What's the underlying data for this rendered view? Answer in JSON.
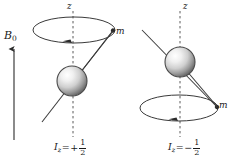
{
  "figure": {
    "background_color": "#ffffff",
    "stroke_color": "#3a3a3a",
    "text_color": "#1a1a1a",
    "width": 237,
    "height": 163
  },
  "field": {
    "symbol": "B",
    "subscript": "0",
    "arrow_direction": "up"
  },
  "panels": [
    {
      "id": "spin-up",
      "axis_label": "z",
      "moment_label": "m",
      "caption": {
        "variable": "I",
        "subscript": "z",
        "equals": "=",
        "sign": "+",
        "numerator": "1",
        "denominator": "2"
      },
      "cone_position": "above",
      "sphere_center": {
        "x": 72,
        "y": 81
      },
      "sphere_radius": 15,
      "ellipse_center": {
        "x": 74,
        "y": 30
      },
      "ellipse_rx": 41,
      "ellipse_ry": 13
    },
    {
      "id": "spin-down",
      "axis_label": "z",
      "moment_label": "m",
      "caption": {
        "variable": "I",
        "subscript": "z",
        "equals": "=",
        "sign": "−",
        "numerator": "1",
        "denominator": "2"
      },
      "cone_position": "below",
      "sphere_center": {
        "x": 180,
        "y": 62
      },
      "sphere_radius": 15,
      "ellipse_center": {
        "x": 179,
        "y": 108
      },
      "ellipse_rx": 39,
      "ellipse_ry": 13
    }
  ],
  "colors": {
    "sphere_highlight": "#fbfbfb",
    "sphere_midtone": "#c9c9c9",
    "sphere_shadow": "#6e6e6e",
    "sphere_outline": "#4a4a4a",
    "line": "#3a3a3a",
    "dashed_axis": "#5a5a5a"
  }
}
